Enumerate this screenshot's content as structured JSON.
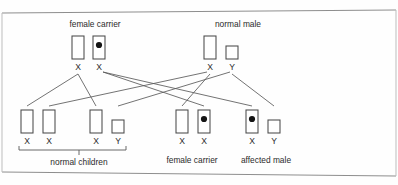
{
  "figure": {
    "type": "pedigree-inheritance-diagram",
    "border_color": "#8e8e8e",
    "box_stroke_color": "#4a4a4a",
    "line_color": "#5a5a5a",
    "allele_dot_color": "#141414"
  },
  "parents": [
    {
      "id": "mother",
      "label": "female carrier",
      "label_x": 95,
      "label_y": 27,
      "chromosomes": [
        {
          "allele": "X",
          "carries_mutation": false,
          "x": 72,
          "y": 36,
          "w": 12,
          "h": 23,
          "letter_x": 78,
          "letter_y": 70
        },
        {
          "allele": "X",
          "carries_mutation": true,
          "x": 93,
          "y": 36,
          "w": 12,
          "h": 23,
          "letter_x": 99,
          "letter_y": 70
        }
      ]
    },
    {
      "id": "father",
      "label": "normal male",
      "label_x": 238,
      "label_y": 27,
      "chromosomes": [
        {
          "allele": "X",
          "carries_mutation": false,
          "x": 204,
          "y": 36,
          "w": 12,
          "h": 23,
          "letter_x": 210,
          "letter_y": 70
        },
        {
          "allele": "Y",
          "carries_mutation": false,
          "x": 226,
          "y": 46,
          "w": 12,
          "h": 13,
          "letter_x": 232,
          "letter_y": 70
        }
      ]
    }
  ],
  "children": [
    {
      "id": "child-1",
      "group": "normal children",
      "chromosomes": [
        {
          "allele": "X",
          "carries_mutation": false,
          "x": 21,
          "y": 110,
          "w": 12,
          "h": 23,
          "letter_x": 27,
          "letter_y": 144
        },
        {
          "allele": "X",
          "carries_mutation": false,
          "x": 43,
          "y": 110,
          "w": 12,
          "h": 23,
          "letter_x": 49,
          "letter_y": 144
        }
      ]
    },
    {
      "id": "child-2",
      "group": "normal children",
      "chromosomes": [
        {
          "allele": "X",
          "carries_mutation": false,
          "x": 90,
          "y": 110,
          "w": 12,
          "h": 23,
          "letter_x": 96,
          "letter_y": 144
        },
        {
          "allele": "Y",
          "carries_mutation": false,
          "x": 112,
          "y": 120,
          "w": 12,
          "h": 13,
          "letter_x": 118,
          "letter_y": 144
        }
      ]
    },
    {
      "id": "child-3",
      "group": "female carrier",
      "chromosomes": [
        {
          "allele": "X",
          "carries_mutation": false,
          "x": 176,
          "y": 110,
          "w": 12,
          "h": 23,
          "letter_x": 182,
          "letter_y": 144
        },
        {
          "allele": "X",
          "carries_mutation": true,
          "x": 198,
          "y": 110,
          "w": 12,
          "h": 23,
          "letter_x": 204,
          "letter_y": 144
        }
      ]
    },
    {
      "id": "child-4",
      "group": "affected male",
      "chromosomes": [
        {
          "allele": "X",
          "carries_mutation": true,
          "x": 246,
          "y": 110,
          "w": 12,
          "h": 23,
          "letter_x": 252,
          "letter_y": 144
        },
        {
          "allele": "Y",
          "carries_mutation": false,
          "x": 268,
          "y": 120,
          "w": 12,
          "h": 13,
          "letter_x": 274,
          "letter_y": 144
        }
      ]
    }
  ],
  "child_labels": [
    {
      "id": "normal-children",
      "text": "normal children",
      "x": 79,
      "y": 165
    },
    {
      "id": "female-carrier-child",
      "text": "female carrier",
      "x": 192,
      "y": 163
    },
    {
      "id": "affected-male-child",
      "text": "affected male",
      "x": 266,
      "y": 163
    }
  ],
  "bracket": {
    "id": "normal-children-bracket",
    "left_x": 19,
    "right_x": 126,
    "y": 150,
    "tick_height": 4,
    "center_x": 79,
    "center_drop": 5
  },
  "inheritance_lines": [
    {
      "id": "mother-x1-to-child1",
      "from": "mother.X1",
      "to": "child-1.X",
      "x1": 78,
      "y1": 74,
      "x2": 27,
      "y2": 106
    },
    {
      "id": "mother-x1-to-child2",
      "from": "mother.X1",
      "to": "child-2.X",
      "x1": 78,
      "y1": 74,
      "x2": 96,
      "y2": 106
    },
    {
      "id": "mother-x2-to-child3",
      "from": "mother.X2",
      "to": "child-3.X2",
      "x1": 103,
      "y1": 72,
      "x2": 204,
      "y2": 106
    },
    {
      "id": "mother-x2-to-child4",
      "from": "mother.X2",
      "to": "child-4.X",
      "x1": 103,
      "y1": 72,
      "x2": 252,
      "y2": 106
    },
    {
      "id": "father-x-to-child1",
      "from": "father.X",
      "to": "child-1.X2",
      "x1": 207,
      "y1": 72,
      "x2": 49,
      "y2": 106
    },
    {
      "id": "father-x-to-child3",
      "from": "father.X",
      "to": "child-3.X1",
      "x1": 210,
      "y1": 74,
      "x2": 182,
      "y2": 106
    },
    {
      "id": "father-y-to-child2",
      "from": "father.Y",
      "to": "child-2.Y",
      "x1": 230,
      "y1": 72,
      "x2": 118,
      "y2": 106
    },
    {
      "id": "father-y-to-child4",
      "from": "father.Y",
      "to": "child-4.Y",
      "x1": 232,
      "y1": 74,
      "x2": 274,
      "y2": 106
    }
  ],
  "frame": {
    "top_line": {
      "x1": 2,
      "y1": 13,
      "x2": 396,
      "y2": 10
    },
    "bottom_line": {
      "x1": 2,
      "y1": 172,
      "x2": 396,
      "y2": 176
    },
    "left_line": {
      "x1": 2,
      "y1": 13,
      "x2": 2,
      "y2": 172
    },
    "right_line": {
      "x1": 396,
      "y1": 10,
      "x2": 396,
      "y2": 176
    }
  }
}
